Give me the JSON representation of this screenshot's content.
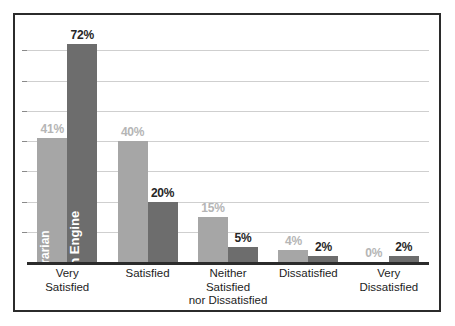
{
  "figure": {
    "top_artifact_text": "",
    "frame_color": "#2b2b2b",
    "background": "#ffffff"
  },
  "chart_data": {
    "type": "bar",
    "title": "",
    "subtitle": "",
    "xlabel": "",
    "ylabel": "",
    "ylim": [
      0,
      80
    ],
    "grid": true,
    "gridline_values": [
      10,
      20,
      30,
      40,
      50,
      60,
      70
    ],
    "legend_position": "in-bar-rotated-labels",
    "value_suffix": "%",
    "categories": [
      "Very Satisfied",
      "Satisfied",
      "Neither Satisfied nor Dissatisfied",
      "Dissatisfied",
      "Very Dissatisfied"
    ],
    "category_lines": [
      [
        "Very",
        "Satisfied"
      ],
      [
        "Satisfied"
      ],
      [
        "Neither",
        "Satisfied",
        "nor Dissatisfied"
      ],
      [
        "Dissatisfied"
      ],
      [
        "Very",
        "Dissatisfied"
      ]
    ],
    "series": [
      {
        "name": "Librarian",
        "color": "#a6a6a6",
        "label_color": "#b5b5b5",
        "values": [
          41,
          40,
          15,
          4,
          0
        ],
        "value_labels": [
          "41%",
          "40%",
          "15%",
          "4%",
          "0%"
        ]
      },
      {
        "name": "Search Engine",
        "color": "#6d6d6d",
        "label_color": "#262626",
        "values": [
          72,
          20,
          5,
          2,
          2
        ],
        "value_labels": [
          "72%",
          "20%",
          "5%",
          "2%",
          "2%"
        ]
      }
    ]
  }
}
